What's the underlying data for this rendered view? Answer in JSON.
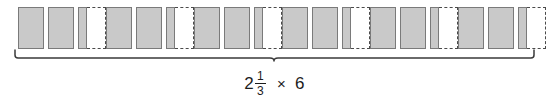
{
  "diagram": {
    "type": "fraction-multiplication-model",
    "expression": {
      "whole_part": "2",
      "numerator": "1",
      "denominator": "3",
      "operator": "×",
      "multiplier": "6",
      "full_text": "2 1/3 × 6"
    },
    "groups_count": 6,
    "whole_units_per_group": 2,
    "partial_filled_thirds": 1,
    "partial_empty_thirds": 2,
    "colors": {
      "fill": "#c9c9c9",
      "stroke": "#7a7a7a",
      "dashed_stroke": "#4a4a4a",
      "text": "#1c1c1c",
      "background": "#ffffff"
    },
    "groups": [
      {
        "id": "group-1",
        "label": "2 1/3"
      },
      {
        "id": "group-2",
        "label": "2 1/3"
      },
      {
        "id": "group-3",
        "label": "2 1/3"
      },
      {
        "id": "group-4",
        "label": "2 1/3"
      },
      {
        "id": "group-5",
        "label": "2 1/3"
      },
      {
        "id": "group-6",
        "label": "2 1/3"
      }
    ]
  }
}
